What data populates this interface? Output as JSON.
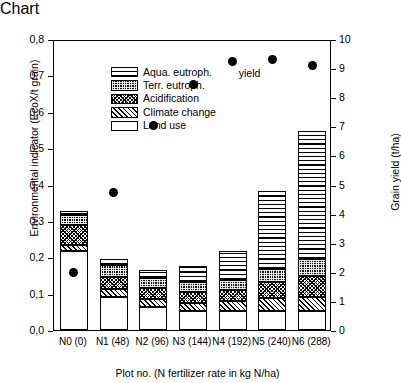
{
  "chart_data": {
    "type": "bar",
    "title": "",
    "xlabel": "Plot no. (N fertilizer rate in kg N/ha)",
    "ylabel": "Environmental indicator (EcoX/t grain)",
    "y2label": "Grain yield (t/ha)",
    "ylim": [
      0.0,
      0.8
    ],
    "y2lim": [
      0,
      10
    ],
    "grid": false,
    "legend_position": "top-left",
    "stacked": true,
    "categories": [
      "N0 (0)",
      "N1 (48)",
      "N2 (96)",
      "N3 (144)",
      "N4 (192)",
      "N5 (240)",
      "N6 (288)"
    ],
    "ytick_labels": [
      "0,0",
      "0,1",
      "0,2",
      "0,3",
      "0,4",
      "0,5",
      "0,6",
      "0,7",
      "0,8"
    ],
    "ytick_values": [
      0.0,
      0.1,
      0.2,
      0.3,
      0.4,
      0.5,
      0.6,
      0.7,
      0.8
    ],
    "y2tick_labels": [
      "0",
      "1",
      "2",
      "3",
      "4",
      "5",
      "6",
      "7",
      "8",
      "9",
      "10"
    ],
    "y2tick_values": [
      0,
      1,
      2,
      3,
      4,
      5,
      6,
      7,
      8,
      9,
      10
    ],
    "series": [
      {
        "name": "Land use",
        "pattern": "open-white",
        "values": [
          0.218,
          0.092,
          0.062,
          0.052,
          0.053,
          0.053,
          0.051
        ]
      },
      {
        "name": "Climate change",
        "pattern": "diagonal-hatch",
        "values": [
          0.015,
          0.022,
          0.023,
          0.022,
          0.026,
          0.036,
          0.04
        ]
      },
      {
        "name": "Acidification",
        "pattern": "cross-hatch",
        "values": [
          0.056,
          0.031,
          0.03,
          0.03,
          0.032,
          0.042,
          0.057
        ]
      },
      {
        "name": "Terr. eutroph.",
        "pattern": "dark-checker",
        "values": [
          0.028,
          0.034,
          0.029,
          0.027,
          0.027,
          0.036,
          0.046
        ]
      },
      {
        "name": "Aqua. eutroph.",
        "pattern": "horizontal-lines",
        "values": [
          0.011,
          0.015,
          0.021,
          0.044,
          0.079,
          0.216,
          0.353
        ]
      }
    ],
    "totals": [
      0.328,
      0.194,
      0.165,
      0.175,
      0.217,
      0.383,
      0.547
    ],
    "overlay_series": {
      "name": "yield",
      "type": "scatter",
      "axis": "right",
      "marker": "filled-circle",
      "color": "#000000",
      "values": [
        2.05,
        4.8,
        7.1,
        8.5,
        9.3,
        9.35,
        9.15
      ]
    },
    "annotations": [
      {
        "text": "yield",
        "x_category": "N4 (192)",
        "position": "below-right-of-point"
      }
    ]
  },
  "legend": {
    "items": [
      {
        "label": "Aqua. eutroph.",
        "icon": "horizontal-lines-swatch"
      },
      {
        "label": "Terr. eutroph.",
        "icon": "dark-checker-swatch"
      },
      {
        "label": "Acidification",
        "icon": "cross-hatch-swatch"
      },
      {
        "label": "Climate change",
        "icon": "diagonal-hatch-swatch"
      },
      {
        "label": "Land use",
        "icon": "open-white-swatch"
      }
    ]
  },
  "axes": {
    "left_title": "Environmental indicator (EcoX/t grain)",
    "right_title": "Grain yield (t/ha)",
    "bottom_title": "Plot no. (N fertilizer rate in kg N/ha)"
  },
  "annotation_yield": "yield"
}
